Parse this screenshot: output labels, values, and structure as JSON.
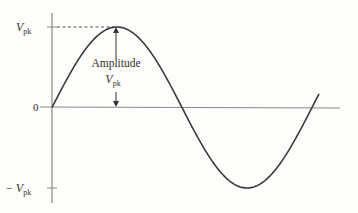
{
  "diagram": {
    "type": "sine-wave-amplitude",
    "labels": {
      "vpk_top": {
        "prefix": "",
        "var": "V",
        "sub": "pk"
      },
      "zero": "0",
      "vpk_bottom": {
        "prefix": "− ",
        "var": "V",
        "sub": "pk"
      },
      "amplitude": "Amplitude",
      "amplitude_var": {
        "var": "V",
        "sub": "pk"
      }
    },
    "waveform": {
      "function": "sine",
      "cycles": 1.1,
      "peak_value_label": "Vpk"
    },
    "colors": {
      "curve": "#3a3a3a",
      "axis": "#8a8a8a",
      "text": "#333333"
    }
  }
}
